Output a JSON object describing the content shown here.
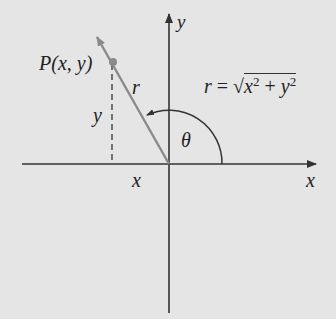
{
  "diagram": {
    "point_label": "P(x, y)",
    "radius_label": "r",
    "angle_label": "θ",
    "x_axis_label": "x",
    "y_axis_label": "y",
    "x_coord_label": "x",
    "y_coord_label": "y",
    "formula": {
      "lhs": "r",
      "eq": "=",
      "sqrt": "√",
      "radicand_x": "x",
      "exp1": "2",
      "plus": "+",
      "radicand_y": "y",
      "exp2": "2"
    },
    "colors": {
      "background": "#e5e5e5",
      "axes": "#333333",
      "radius_line": "#8a8a8a",
      "text": "#222222"
    }
  }
}
